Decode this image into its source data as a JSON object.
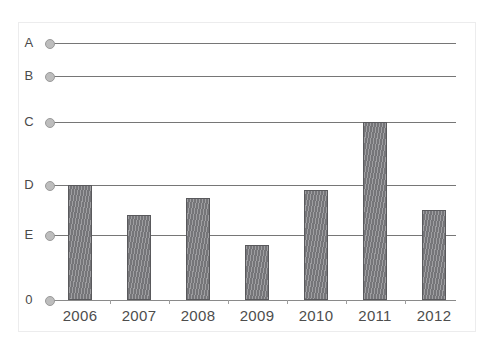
{
  "chart_data": {
    "type": "bar",
    "title": "",
    "xlabel": "",
    "ylabel": "",
    "grid": true,
    "legend": null,
    "categories": [
      "2006",
      "2007",
      "2008",
      "2009",
      "2010",
      "2011",
      "2012"
    ],
    "values": [
      2.0,
      1.4,
      1.74,
      0.85,
      1.9,
      3.0,
      1.5
    ],
    "ytick_labels": [
      "0",
      "E",
      "D",
      "C",
      "B",
      "A"
    ],
    "ytick_values": [
      0,
      1,
      2,
      3,
      4,
      5
    ],
    "ytick_pixel_y": [
      300,
      235,
      185,
      122,
      76,
      43
    ],
    "ylim": [
      0,
      5
    ],
    "value_scale_note": "Categorical ordinal y-axis: 0 < E < D < C < B < A, unevenly spaced.",
    "bar_color": "#7c7c80",
    "bar_edge_color": "#59595c",
    "gridline_color": "#767676",
    "marker_color": "#bdbdbd",
    "background_color": "#ffffff",
    "series": [
      {
        "name": "values",
        "points": [
          {
            "x": "2006",
            "y": 2.0,
            "reaches": "D"
          },
          {
            "x": "2007",
            "y": 1.4,
            "reaches": "between E and D"
          },
          {
            "x": "2008",
            "y": 1.74,
            "reaches": "between E and D"
          },
          {
            "x": "2009",
            "y": 0.85,
            "reaches": "below E"
          },
          {
            "x": "2010",
            "y": 1.9,
            "reaches": "just below D"
          },
          {
            "x": "2011",
            "y": 3.0,
            "reaches": "C"
          },
          {
            "x": "2012",
            "y": 1.5,
            "reaches": "between E and D"
          }
        ]
      }
    ]
  },
  "axes": {
    "y": [
      {
        "label": "A",
        "pixel_y": 43
      },
      {
        "label": "B",
        "pixel_y": 76
      },
      {
        "label": "C",
        "pixel_y": 122
      },
      {
        "label": "D",
        "pixel_y": 185
      },
      {
        "label": "E",
        "pixel_y": 235
      },
      {
        "label": "0",
        "pixel_y": 300
      }
    ],
    "x": [
      {
        "label": "2006",
        "center_x": 80
      },
      {
        "label": "2007",
        "center_x": 139
      },
      {
        "label": "2008",
        "center_x": 198
      },
      {
        "label": "2009",
        "center_x": 257
      },
      {
        "label": "2010",
        "center_x": 316
      },
      {
        "label": "2011",
        "center_x": 375
      },
      {
        "label": "2012",
        "center_x": 434
      }
    ]
  }
}
